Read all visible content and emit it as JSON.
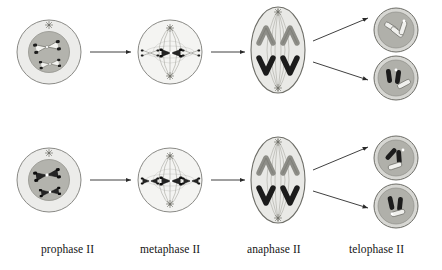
{
  "figure": {
    "type": "biological-process-diagram",
    "rows": 2,
    "columns": 4
  },
  "stage_labels": [
    {
      "id": "prophase-ii",
      "text": "prophase II",
      "x": 41,
      "y": 249
    },
    {
      "id": "metaphase-ii",
      "text": "metaphase II",
      "x": 140,
      "y": 249
    },
    {
      "id": "anaphase-ii",
      "text": "anaphase II",
      "x": 247,
      "y": 249
    },
    {
      "id": "telophase-ii",
      "text": "telophase II",
      "x": 349,
      "y": 249
    }
  ],
  "palette": {
    "cell_outline": "#8a8a86",
    "cytoplasm_light": "#ececea",
    "nucleus_gray": "#b3b3ad",
    "nucleus_gray_dark": "#a8a8a2",
    "telophase_fill": "#b0b0aa",
    "anaphase_fill": "#e6e6e3",
    "chromosome_light": "#f2f2ef",
    "chromosome_mid": "#9a9a94",
    "chromosome_dark": "#1c1c1c",
    "spindle_line": "#9d9d97",
    "arrow": "#2a2a2a",
    "text": "#141414"
  },
  "cells": {
    "prophase_top": {
      "name": "prophase-ii-cell-top",
      "cx": 49,
      "cy": 52,
      "r_outer": 32,
      "r_nucleus": 20,
      "centrosome_count": 1,
      "chromosomes": [
        {
          "tone": "light",
          "shape": "x-shaped"
        },
        {
          "tone": "light",
          "shape": "x-shaped"
        }
      ]
    },
    "prophase_bottom": {
      "name": "prophase-ii-cell-bottom",
      "cx": 49,
      "cy": 180,
      "r_outer": 32,
      "r_nucleus": 20,
      "centrosome_count": 1,
      "chromosomes": [
        {
          "tone": "dark",
          "shape": "x-shaped"
        },
        {
          "tone": "dark",
          "shape": "x-shaped"
        }
      ]
    },
    "metaphase_top": {
      "name": "metaphase-ii-cell-top",
      "cx": 170,
      "cy": 52,
      "r_outer": 32,
      "centrosome_count": 2,
      "spindle": true,
      "chromosomes": [
        {
          "tone": "light",
          "position": "equator-left"
        },
        {
          "tone": "dark",
          "position": "equator-center"
        },
        {
          "tone": "light",
          "position": "equator-right"
        }
      ]
    },
    "metaphase_bottom": {
      "name": "metaphase-ii-cell-bottom",
      "cx": 170,
      "cy": 180,
      "r_outer": 32,
      "centrosome_count": 2,
      "spindle": true,
      "chromosomes": [
        {
          "tone": "dark",
          "position": "equator-left"
        },
        {
          "tone": "dark",
          "position": "equator-center"
        },
        {
          "tone": "dark",
          "position": "equator-right"
        }
      ]
    },
    "anaphase_top": {
      "name": "anaphase-ii-cell-top",
      "cx": 278,
      "cy": 50,
      "rx": 27,
      "ry": 43,
      "centrosome_count": 2,
      "spindle": true,
      "chromosomes": [
        {
          "tone": "mid",
          "shape": "v-shaped",
          "pole": "top-left"
        },
        {
          "tone": "mid",
          "shape": "v-shaped",
          "pole": "top-right"
        },
        {
          "tone": "dark",
          "shape": "v-shaped",
          "pole": "bottom-left"
        },
        {
          "tone": "dark",
          "shape": "v-shaped",
          "pole": "bottom-right"
        }
      ]
    },
    "anaphase_bottom": {
      "name": "anaphase-ii-cell-bottom",
      "cx": 278,
      "cy": 180,
      "rx": 27,
      "ry": 43,
      "centrosome_count": 2,
      "spindle": true,
      "chromosomes": [
        {
          "tone": "mid",
          "shape": "v-shaped",
          "pole": "top-left"
        },
        {
          "tone": "mid",
          "shape": "v-shaped",
          "pole": "top-right"
        },
        {
          "tone": "dark",
          "shape": "v-shaped",
          "pole": "bottom-left"
        },
        {
          "tone": "dark",
          "shape": "v-shaped",
          "pole": "bottom-right"
        }
      ]
    },
    "telophase_1": {
      "name": "telophase-ii-daughter-cell-1",
      "cx": 396,
      "cy": 30,
      "r_outer": 22,
      "r_inner": 18,
      "chromosomes": [
        {
          "tone": "light"
        },
        {
          "tone": "light"
        },
        {
          "tone": "light"
        }
      ]
    },
    "telophase_2": {
      "name": "telophase-ii-daughter-cell-2",
      "cx": 396,
      "cy": 78,
      "r_outer": 22,
      "r_inner": 18,
      "chromosomes": [
        {
          "tone": "dark"
        },
        {
          "tone": "dark"
        },
        {
          "tone": "light"
        }
      ]
    },
    "telophase_3": {
      "name": "telophase-ii-daughter-cell-3",
      "cx": 396,
      "cy": 158,
      "r_outer": 22,
      "r_inner": 18,
      "chromosomes": [
        {
          "tone": "dark"
        },
        {
          "tone": "dark"
        },
        {
          "tone": "light"
        }
      ]
    },
    "telophase_4": {
      "name": "telophase-ii-daughter-cell-4",
      "cx": 396,
      "cy": 206,
      "r_outer": 22,
      "r_inner": 18,
      "chromosomes": [
        {
          "tone": "dark"
        },
        {
          "tone": "dark"
        },
        {
          "tone": "light"
        }
      ]
    }
  },
  "arrows": [
    {
      "id": "arrow-prophase-to-metaphase-top",
      "x1": 90,
      "y1": 52,
      "x2": 133,
      "y2": 52
    },
    {
      "id": "arrow-metaphase-to-anaphase-top",
      "x1": 211,
      "y1": 52,
      "x2": 246,
      "y2": 52
    },
    {
      "id": "arrow-anaphase-to-telophase-top-1",
      "x1": 312,
      "y1": 40,
      "x2": 369,
      "y2": 17
    },
    {
      "id": "arrow-anaphase-to-telophase-top-2",
      "x1": 312,
      "y1": 62,
      "x2": 369,
      "y2": 80
    },
    {
      "id": "arrow-prophase-to-metaphase-bottom",
      "x1": 90,
      "y1": 180,
      "x2": 133,
      "y2": 180
    },
    {
      "id": "arrow-metaphase-to-anaphase-bottom",
      "x1": 211,
      "y1": 180,
      "x2": 246,
      "y2": 180
    },
    {
      "id": "arrow-anaphase-to-telophase-bot-1",
      "x1": 312,
      "y1": 170,
      "x2": 369,
      "y2": 146
    },
    {
      "id": "arrow-anaphase-to-telophase-bot-2",
      "x1": 312,
      "y1": 192,
      "x2": 369,
      "y2": 208
    }
  ]
}
